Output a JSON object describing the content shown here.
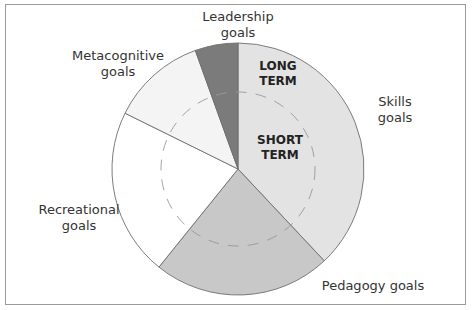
{
  "chart_data": {
    "type": "pie",
    "title": "",
    "start_angle_deg_from_top": 0,
    "direction": "clockwise",
    "slices": [
      {
        "name": "Skills goals",
        "percent": 38.0,
        "color": "#e3e3e3"
      },
      {
        "name": "Pedagogy goals",
        "percent": 22.8,
        "color": "#c8c8c8"
      },
      {
        "name": "Recreational goals",
        "percent": 21.5,
        "color": "#ffffff"
      },
      {
        "name": "Metacognitive goals",
        "percent": 12.2,
        "color": "#f4f4f4"
      },
      {
        "name": "Leadership goals",
        "percent": 5.5,
        "color": "#7b7b7b"
      }
    ],
    "annotations": {
      "outer_ring": "LONG TERM",
      "inner_ring": "SHORT TERM",
      "inner_ring_style": "dashed circle"
    }
  },
  "labels": {
    "leadership": [
      "Leadership",
      "goals"
    ],
    "metacognitive": [
      "Metacognitive",
      "goals"
    ],
    "skills": [
      "Skills",
      "goals"
    ],
    "recreational": [
      "Recreational",
      "goals"
    ],
    "pedagogy": "Pedagogy goals",
    "long_term": [
      "LONG",
      "TERM"
    ],
    "short_term": [
      "SHORT",
      "TERM"
    ]
  }
}
